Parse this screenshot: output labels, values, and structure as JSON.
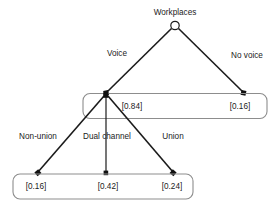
{
  "diagram": {
    "type": "tree",
    "root": {
      "label": "Workplaces",
      "marker": "hollow-circle"
    },
    "level1": {
      "edges": [
        {
          "label": "Voice",
          "marker": "filled-square"
        },
        {
          "label": "No voice",
          "marker": "filled-square"
        }
      ],
      "values": [
        {
          "text": "[0.84]",
          "value": 0.84
        },
        {
          "text": "[0.16]",
          "value": 0.16
        }
      ],
      "grouped": true
    },
    "level2": {
      "edges": [
        {
          "label": "Non-union",
          "marker": "filled-square"
        },
        {
          "label": "Dual channel",
          "marker": "filled-square"
        },
        {
          "label": "Union",
          "marker": "filled-square"
        }
      ],
      "values": [
        {
          "text": "[0.16]",
          "value": 0.16
        },
        {
          "text": "[0.42]",
          "value": 0.42
        },
        {
          "text": "[0.24]",
          "value": 0.24
        }
      ],
      "grouped": true
    },
    "colors": {
      "line": "#1b1b1b",
      "box": "#8d8d8d",
      "text": "#1b1b1b",
      "background": "#ffffff"
    }
  }
}
